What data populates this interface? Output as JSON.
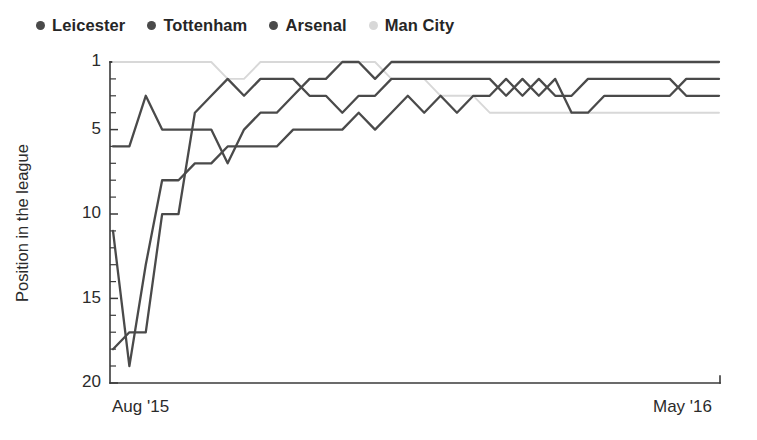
{
  "legend": {
    "position": "top-left",
    "items": [
      {
        "label": "Leicester",
        "color": "#4a4a4a",
        "icon": "legend-dot-icon"
      },
      {
        "label": "Tottenham",
        "color": "#4a4a4a",
        "icon": "legend-dot-icon"
      },
      {
        "label": "Arsenal",
        "color": "#4a4a4a",
        "icon": "legend-dot-icon"
      },
      {
        "label": "Man City",
        "color": "#d8d8d8",
        "icon": "legend-dot-icon"
      }
    ]
  },
  "axes": {
    "y_title": "Position in the league",
    "y_ticks": [
      "1",
      "5",
      "10",
      "15",
      "20"
    ],
    "x_tick_left": "Aug '15",
    "x_tick_right": "May '16"
  },
  "chart_data": {
    "type": "line",
    "title": "",
    "subtitle": "",
    "xlabel": "",
    "ylabel": "Position in the league",
    "xlim": [
      "Aug '15",
      "May '16"
    ],
    "ylim": [
      1,
      20
    ],
    "y_inverted": true,
    "y_ticks": [
      1,
      5,
      10,
      15,
      20
    ],
    "y_minor_tick_step": 1,
    "grid": false,
    "legend_position": "top-left",
    "x_unit": "matchweek",
    "x": [
      1,
      2,
      3,
      4,
      5,
      6,
      7,
      8,
      9,
      10,
      11,
      12,
      13,
      14,
      15,
      16,
      17,
      18,
      19,
      20,
      21,
      22,
      23,
      24,
      25,
      26,
      27,
      28,
      29,
      30,
      31,
      32,
      33,
      34,
      35,
      36,
      37,
      38
    ],
    "series": [
      {
        "name": "Leicester",
        "color": "#4a4a4a",
        "values": [
          6,
          6,
          3,
          5,
          5,
          5,
          5,
          7,
          5,
          4,
          4,
          3,
          2,
          2,
          1,
          1,
          2,
          1,
          1,
          1,
          1,
          1,
          1,
          1,
          1,
          1,
          1,
          1,
          1,
          1,
          1,
          1,
          1,
          1,
          1,
          1,
          1,
          1
        ]
      },
      {
        "name": "Tottenham",
        "color": "#4a4a4a",
        "values": [
          11,
          19,
          13,
          8,
          8,
          7,
          7,
          6,
          6,
          6,
          6,
          5,
          5,
          5,
          5,
          4,
          5,
          4,
          3,
          4,
          3,
          4,
          3,
          3,
          2,
          3,
          2,
          3,
          3,
          2,
          2,
          2,
          2,
          2,
          2,
          3,
          3,
          3
        ]
      },
      {
        "name": "Arsenal",
        "color": "#4a4a4a",
        "values": [
          18,
          17,
          17,
          10,
          10,
          4,
          3,
          2,
          3,
          2,
          2,
          2,
          3,
          3,
          4,
          3,
          3,
          2,
          2,
          2,
          2,
          2,
          2,
          2,
          3,
          2,
          3,
          2,
          4,
          4,
          3,
          3,
          3,
          3,
          3,
          2,
          2,
          2
        ]
      },
      {
        "name": "Man City",
        "color": "#d8d8d8",
        "values": [
          1,
          1,
          1,
          1,
          1,
          1,
          1,
          2,
          2,
          1,
          1,
          1,
          1,
          1,
          1,
          1,
          1,
          2,
          2,
          2,
          3,
          3,
          3,
          4,
          4,
          4,
          4,
          4,
          4,
          4,
          4,
          4,
          4,
          4,
          4,
          4,
          4,
          4
        ]
      }
    ]
  }
}
